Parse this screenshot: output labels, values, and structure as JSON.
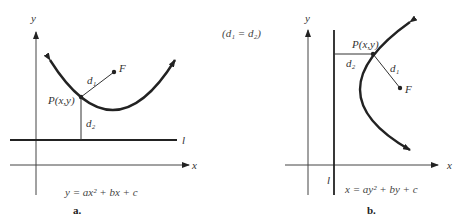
{
  "relation": "(d₁ = d₂)",
  "panels": [
    {
      "id": "a",
      "caption": "a.",
      "equation": "y = ax² + bx + c",
      "labels": {
        "x_axis": "x",
        "y_axis": "y",
        "directrix": "l",
        "point": "P(x,y)",
        "focus": "F",
        "d1": "d₁",
        "d2": "d₂"
      },
      "orientation": "vertical-parabola-opening-up"
    },
    {
      "id": "b",
      "caption": "b.",
      "equation": "x = ay² + by + c",
      "labels": {
        "x_axis": "x",
        "y_axis": "y",
        "directrix": "l",
        "point": "P(x,y)",
        "focus": "F",
        "d1": "d₁",
        "d2": "d₂"
      },
      "orientation": "horizontal-parabola-opening-right"
    }
  ]
}
